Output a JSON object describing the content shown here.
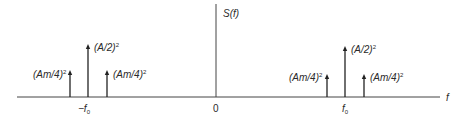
{
  "diagram": {
    "title": "S(f)",
    "axis": {
      "horizontal_label": "f",
      "vertical_label": "S(f)",
      "ticks": [
        {
          "id": "neg-f0",
          "label": "−f",
          "sub": "0"
        },
        {
          "id": "zero",
          "label": "0"
        },
        {
          "id": "pos-f0",
          "label": "f",
          "sub": "0"
        }
      ]
    },
    "left_group": {
      "center_label": "−f0",
      "impulses": [
        {
          "position": "-f0 - fm",
          "label": "(Am/4)",
          "exponent": "2",
          "height": "short"
        },
        {
          "position": "-f0",
          "label": "(A/2)",
          "exponent": "2",
          "height": "tall"
        },
        {
          "position": "-f0 + fm",
          "label": "(Am/4)",
          "exponent": "2",
          "height": "short"
        }
      ]
    },
    "right_group": {
      "center_label": "f0",
      "impulses": [
        {
          "position": "f0 - fm",
          "label": "(Am/4)",
          "exponent": "2",
          "height": "short"
        },
        {
          "position": "f0",
          "label": "(A/2)",
          "exponent": "2",
          "height": "tall"
        },
        {
          "position": "f0 + fm",
          "label": "(Am/4)",
          "exponent": "2",
          "height": "short"
        }
      ]
    },
    "colors": {
      "line": "#333333",
      "text": "#2a2a2a",
      "background": "#ffffff"
    }
  }
}
